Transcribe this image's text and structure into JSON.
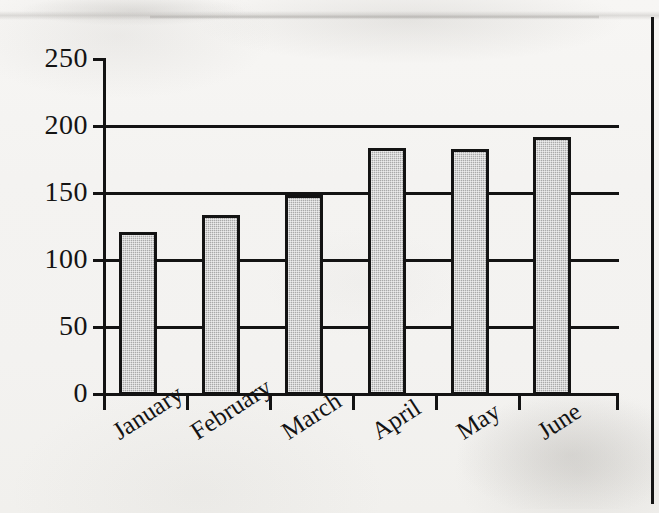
{
  "page": {
    "kind": "scanned-textbook-figure",
    "background_color": "#f4f3f1",
    "ink_color": "#131313",
    "bar_fill_color": "#a9a9a9"
  },
  "chart_data": {
    "type": "bar",
    "title": "",
    "subtitle": "",
    "xlabel": "",
    "ylabel": "",
    "categories": [
      "January",
      "February",
      "March",
      "April",
      "May",
      "June"
    ],
    "values": [
      121,
      134,
      149,
      184,
      183,
      192
    ],
    "series": [
      {
        "name": "",
        "values": [
          121,
          134,
          149,
          184,
          183,
          192
        ]
      }
    ],
    "ylim": [
      0,
      250
    ],
    "yticks": [
      0,
      50,
      100,
      150,
      200,
      250
    ],
    "ytick_labels": [
      "0",
      "50",
      "100",
      "150",
      "200",
      "250"
    ],
    "grid": "horizontal",
    "gridlines_at": [
      50,
      100,
      150,
      200
    ],
    "legend": "none",
    "xtick_label_rotation_deg": -33,
    "bar_fill": "gray-halftone",
    "bar_edge": "black"
  },
  "axes": {
    "y_tick_labels": [
      "250",
      "200",
      "150",
      "100",
      "50",
      "0"
    ],
    "x_tick_labels": [
      "January",
      "February",
      "March",
      "April",
      "May",
      "June"
    ]
  }
}
